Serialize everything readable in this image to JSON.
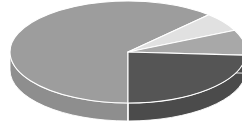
{
  "chart_data": {
    "type": "pie",
    "title": "",
    "subtitle": "",
    "xlabel": "",
    "ylabel": "",
    "grid": false,
    "legend": "none",
    "three_d": true,
    "labels": [
      "Slice 1",
      "Slice 2",
      "Slice 3",
      "Slice 4"
    ],
    "values": [
      62,
      24,
      8,
      6
    ],
    "units": "percent",
    "annotations": [],
    "tick_labels": [],
    "colors": {
      "slice_1_top": "#9d9d9d",
      "slice_1_side": "#8e8e8e",
      "slice_2_top": "#555555",
      "slice_2_side": "#4b4b4b",
      "slice_3_top": "#a8a8a8",
      "slice_3_side": "#9a9a9a",
      "slice_4_top": "#e1e1e1",
      "slice_4_side": "#cfcfcf",
      "separator": "#ffffff",
      "background": "#ffffff"
    },
    "geometry": {
      "center_x": 128,
      "center_y": 52,
      "radius_x": 118,
      "radius_y": 51,
      "depth": 18,
      "start_angle_deg": 90,
      "direction": "counterclockwise"
    },
    "series": [
      {
        "name": "Slice 1",
        "value": 62,
        "color": "#9d9d9d",
        "start_deg": 90,
        "end_deg": 313.2
      },
      {
        "name": "Slice 4",
        "value": 6,
        "color": "#e1e1e1",
        "start_deg": 313.2,
        "end_deg": 334.8
      },
      {
        "name": "Slice 3",
        "value": 8,
        "color": "#a8a8a8",
        "start_deg": 334.8,
        "end_deg": 363.6
      },
      {
        "name": "Slice 2",
        "value": 24,
        "color": "#555555",
        "start_deg": 363.6,
        "end_deg": 450.0
      }
    ]
  },
  "figure": {
    "width": 242,
    "height": 127,
    "name": "pie-chart-3d"
  }
}
